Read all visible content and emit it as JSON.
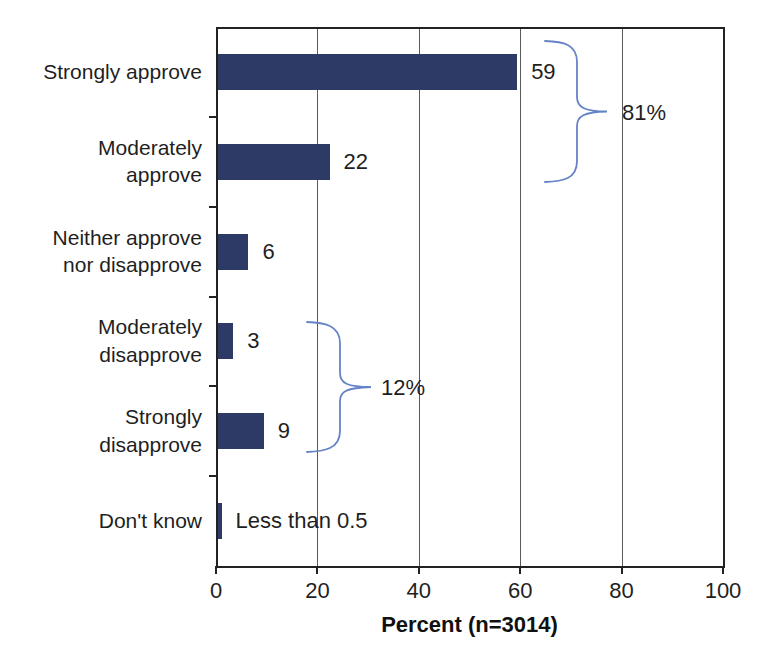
{
  "chart_data": {
    "type": "bar",
    "orientation": "horizontal",
    "title": "",
    "xlabel": "Percent (n=3014)",
    "ylabel": "",
    "categories": [
      "Strongly approve",
      "Moderately\napprove",
      "Neither approve\nnor disapprove",
      "Moderately\ndisapprove",
      "Strongly\ndisapprove",
      "Don't know"
    ],
    "values": [
      59,
      22,
      6,
      3,
      9,
      0.5
    ],
    "value_labels": [
      "59",
      "22",
      "6",
      "3",
      "9",
      "Less than 0.5"
    ],
    "x_ticks": [
      0,
      20,
      40,
      60,
      80,
      100
    ],
    "x_tick_labels": [
      "0",
      "20",
      "40",
      "60",
      "80",
      "100"
    ],
    "xlim": [
      0,
      100
    ],
    "grid": "vertical gridlines at each x tick",
    "legend": "none",
    "bar_color": "#2d3a66",
    "brace_color": "#6583c6",
    "annotations": [
      {
        "label": "81%",
        "covers": [
          "Strongly approve",
          "Moderately approve"
        ]
      },
      {
        "label": "12%",
        "covers": [
          "Moderately disapprove",
          "Strongly disapprove"
        ]
      }
    ]
  }
}
